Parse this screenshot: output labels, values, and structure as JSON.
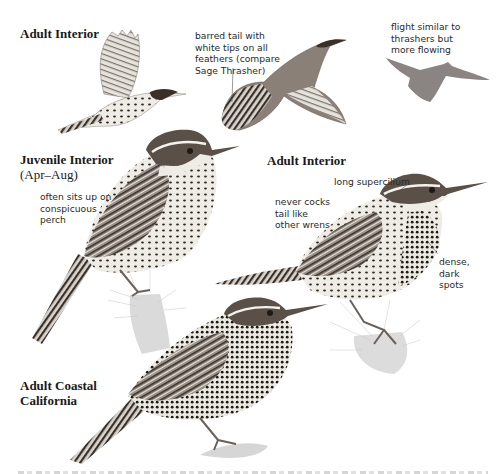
{
  "page": {
    "figures": [
      {
        "id": "adult-interior-flight",
        "title": "Adult Interior",
        "notes": []
      },
      {
        "id": "adult-interior-tail",
        "title": "",
        "notes": [
          "barred tail with\nwhite tips on all\nfeathers (compare\nSage Thrasher)"
        ]
      },
      {
        "id": "flight-silhouette",
        "title": "",
        "notes": [
          "flight similar to\nthrashers but\nmore flowing"
        ]
      },
      {
        "id": "juvenile-interior",
        "title": "Juvenile Interior",
        "subtitle": "(Apr–Aug)",
        "notes": [
          "often sits up on\nconspicuous\nperch"
        ]
      },
      {
        "id": "adult-interior-perched",
        "title": "Adult Interior",
        "notes": [
          "never cocks\ntail like\nother wrens",
          "long supercilium",
          "dense,\ndark\nspots"
        ]
      },
      {
        "id": "adult-coastal-california",
        "title": "Adult Coastal",
        "subtitle": "California",
        "notes": []
      }
    ]
  },
  "colors": {
    "ink": "#1a1a1a",
    "plumage_dark": "#3a3028",
    "plumage_mid": "#8a8078",
    "belly": "#ece8e2",
    "cactus": "#d6d6d6"
  }
}
